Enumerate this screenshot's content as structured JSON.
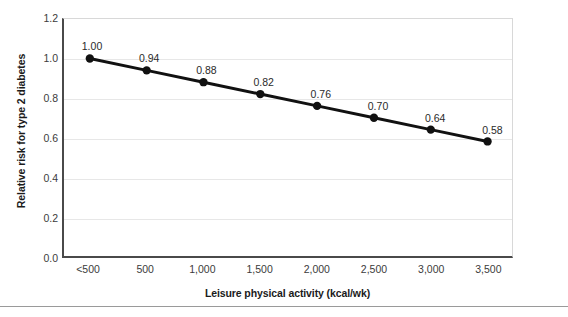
{
  "chart_data": {
    "type": "line",
    "title": "",
    "subtitle": "",
    "xlabel": "Leisure physical activity (kcal/wk)",
    "ylabel": "Relative risk for type 2 diabetes",
    "categories": [
      "<500",
      "500",
      "1,000",
      "1,500",
      "2,000",
      "2,500",
      "3,000",
      "3,500"
    ],
    "values": [
      1.0,
      0.94,
      0.88,
      0.82,
      0.76,
      0.7,
      0.64,
      0.58
    ],
    "point_labels": [
      "1.00",
      "0.94",
      "0.88",
      "0.82",
      "0.76",
      "0.70",
      "0.64",
      "0.58"
    ],
    "ylim": [
      0.0,
      1.2
    ],
    "y_ticks": [
      0.0,
      0.2,
      0.4,
      0.6,
      0.8,
      1.0,
      1.2
    ],
    "y_tick_labels": [
      "0.0",
      "0.2",
      "0.4",
      "0.6",
      "0.8",
      "1.0",
      "1.2"
    ],
    "grid": true,
    "grid_axis": "y",
    "legend": false,
    "legend_position": "none",
    "series": [
      {
        "name": "Relative risk for type 2 diabetes",
        "values": [
          1.0,
          0.94,
          0.88,
          0.82,
          0.76,
          0.7,
          0.64,
          0.58
        ],
        "line_color": "#111111",
        "marker": "circle",
        "marker_color": "#111111"
      }
    ],
    "colors": {
      "line": "#111111",
      "marker": "#111111",
      "gridline": "#e7e7e7",
      "axis": "#4a4a4a",
      "frame": "#d8d8d8",
      "background": "#ffffff",
      "text": "#2a2a2a",
      "rule": "#9a9a9a"
    }
  }
}
